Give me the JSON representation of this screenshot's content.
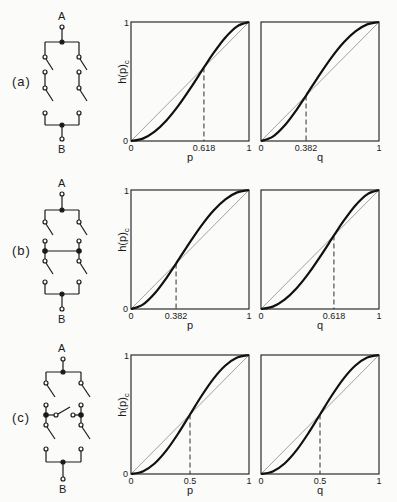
{
  "chart_data": [
    {
      "type": "line",
      "panel": "(a)",
      "circuit": "two series pairs of switches in parallel between A and B",
      "plots": [
        {
          "xlabel": "p",
          "ylabel": "h(p)c",
          "xlim": [
            0,
            1
          ],
          "ylim": [
            0,
            1
          ],
          "x_ticks": [
            "0",
            "0.618",
            "1"
          ],
          "y_ticks": [
            "0",
            "1"
          ],
          "crossover": 0.618,
          "series": [
            {
              "name": "h(p)",
              "x": [
                0,
                0.1,
                0.2,
                0.3,
                0.4,
                0.5,
                0.618,
                0.7,
                0.8,
                0.9,
                1
              ],
              "values": [
                0,
                0.0199,
                0.0784,
                0.1719,
                0.2944,
                0.4375,
                0.618,
                0.7399,
                0.8704,
                0.9639,
                1
              ]
            },
            {
              "name": "diagonal",
              "x": [
                0,
                1
              ],
              "values": [
                0,
                1
              ]
            }
          ]
        },
        {
          "xlabel": "q",
          "ylabel": "",
          "xlim": [
            0,
            1
          ],
          "ylim": [
            0,
            1
          ],
          "x_ticks": [
            "0",
            "0.382",
            "1"
          ],
          "y_ticks": [],
          "crossover": 0.382,
          "series": [
            {
              "name": "h(q)",
              "x": [
                0,
                0.1,
                0.2,
                0.3,
                0.382,
                0.5,
                0.6,
                0.7,
                0.8,
                0.9,
                1
              ],
              "values": [
                0,
                0.0361,
                0.1296,
                0.2601,
                0.382,
                0.5625,
                0.7056,
                0.8281,
                0.9216,
                0.9801,
                1
              ]
            },
            {
              "name": "diagonal",
              "x": [
                0,
                1
              ],
              "values": [
                0,
                1
              ]
            }
          ]
        }
      ]
    },
    {
      "type": "line",
      "panel": "(b)",
      "circuit": "two parallel pairs of switches in series between A and B (bridged middle)",
      "plots": [
        {
          "xlabel": "p",
          "ylabel": "h(p)c",
          "xlim": [
            0,
            1
          ],
          "ylim": [
            0,
            1
          ],
          "x_ticks": [
            "0",
            "0.382",
            "1"
          ],
          "y_ticks": [
            "0",
            "1"
          ],
          "crossover": 0.382,
          "series": [
            {
              "name": "h(p)",
              "x": [
                0,
                0.1,
                0.2,
                0.3,
                0.382,
                0.5,
                0.6,
                0.7,
                0.8,
                0.9,
                1
              ],
              "values": [
                0,
                0.0361,
                0.1296,
                0.2601,
                0.382,
                0.5625,
                0.7056,
                0.8281,
                0.9216,
                0.9801,
                1
              ]
            },
            {
              "name": "diagonal",
              "x": [
                0,
                1
              ],
              "values": [
                0,
                1
              ]
            }
          ]
        },
        {
          "xlabel": "q",
          "ylabel": "",
          "xlim": [
            0,
            1
          ],
          "ylim": [
            0,
            1
          ],
          "x_ticks": [
            "0",
            "0.618",
            "1"
          ],
          "y_ticks": [],
          "crossover": 0.618,
          "series": [
            {
              "name": "h(q)",
              "x": [
                0,
                0.1,
                0.2,
                0.3,
                0.4,
                0.5,
                0.618,
                0.7,
                0.8,
                0.9,
                1
              ],
              "values": [
                0,
                0.0199,
                0.0784,
                0.1719,
                0.2944,
                0.4375,
                0.618,
                0.7399,
                0.8704,
                0.9639,
                1
              ]
            },
            {
              "name": "diagonal",
              "x": [
                0,
                1
              ],
              "values": [
                0,
                1
              ]
            }
          ]
        }
      ]
    },
    {
      "type": "line",
      "panel": "(c)",
      "circuit": "bridge network of five switches between A and B",
      "plots": [
        {
          "xlabel": "p",
          "ylabel": "h(p)c",
          "xlim": [
            0,
            1
          ],
          "ylim": [
            0,
            1
          ],
          "x_ticks": [
            "0",
            "0.5",
            "1"
          ],
          "y_ticks": [
            "0",
            "1"
          ],
          "crossover": 0.5,
          "series": [
            {
              "name": "h(p)",
              "x": [
                0,
                0.1,
                0.2,
                0.3,
                0.4,
                0.5,
                0.6,
                0.7,
                0.8,
                0.9,
                1
              ],
              "values": [
                0,
                0.0215,
                0.0886,
                0.1984,
                0.3405,
                0.5,
                0.6595,
                0.8016,
                0.9114,
                0.9785,
                1
              ]
            },
            {
              "name": "diagonal",
              "x": [
                0,
                1
              ],
              "values": [
                0,
                1
              ]
            }
          ]
        },
        {
          "xlabel": "q",
          "ylabel": "",
          "xlim": [
            0,
            1
          ],
          "ylim": [
            0,
            1
          ],
          "x_ticks": [
            "0",
            "0.5",
            "1"
          ],
          "y_ticks": [],
          "crossover": 0.5,
          "series": [
            {
              "name": "h(q)",
              "x": [
                0,
                0.1,
                0.2,
                0.3,
                0.4,
                0.5,
                0.6,
                0.7,
                0.8,
                0.9,
                1
              ],
              "values": [
                0,
                0.0215,
                0.0886,
                0.1984,
                0.3405,
                0.5,
                0.6595,
                0.8016,
                0.9114,
                0.9785,
                1
              ]
            },
            {
              "name": "diagonal",
              "x": [
                0,
                1
              ],
              "values": [
                0,
                1
              ]
            }
          ]
        }
      ]
    }
  ],
  "panels": [
    {
      "label": "(a)",
      "node_top": "A",
      "node_bottom": "B"
    },
    {
      "label": "(b)",
      "node_top": "A",
      "node_bottom": "B"
    },
    {
      "label": "(c)",
      "node_top": "A",
      "node_bottom": "B"
    }
  ],
  "colors": {
    "ink": "#1a1a1a",
    "diagonal": "#888888",
    "paper": "#fbfbf9"
  }
}
